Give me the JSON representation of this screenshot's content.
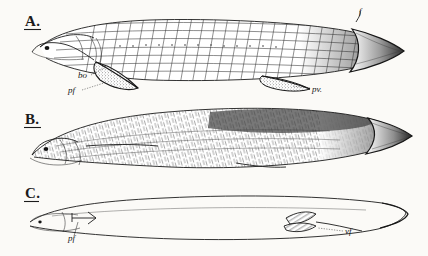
{
  "figure": {
    "background_color": "#fbfaf7",
    "ink_color": "#1c1c1c",
    "caption": "",
    "style": "vintage line engraving, stipple and hatching"
  },
  "panels": [
    {
      "letter": "A.",
      "name": "panel-a",
      "subject": "scaled ganoid fish with rhomboid scale rows",
      "labels": [
        {
          "key": "bo",
          "text": "bo",
          "meaning": "branchiostegal / opercular region",
          "leader": "dotted"
        },
        {
          "key": "pf",
          "text": "pf",
          "meaning": "pectoral fin",
          "leader": "dotted"
        },
        {
          "key": "pv",
          "text": "pv.",
          "meaning": "pelvic / ventral fin",
          "leader": "dotted"
        },
        {
          "key": "f",
          "text": "f",
          "meaning": "dorsal finlet",
          "leader": "plain"
        }
      ]
    },
    {
      "letter": "B.",
      "name": "panel-b",
      "subject": "elongate fish with fine myomere hatching",
      "labels": []
    },
    {
      "letter": "C.",
      "name": "panel-c",
      "subject": "transparent larval eel in outline",
      "labels": [
        {
          "key": "pf",
          "text": "pf",
          "meaning": "pectoral fin",
          "leader": "plain"
        },
        {
          "key": "vf",
          "text": "vf",
          "meaning": "ventral fin",
          "leader": "dotted"
        }
      ]
    }
  ]
}
